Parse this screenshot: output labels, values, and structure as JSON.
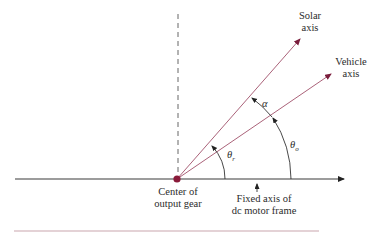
{
  "diagram": {
    "labels": {
      "solar_axis": [
        "Solar",
        "axis"
      ],
      "vehicle_axis": [
        "Vehicle",
        "axis"
      ],
      "center": [
        "Center of",
        "output gear"
      ],
      "fixed_axis": [
        "Fixed axis of",
        "dc motor frame"
      ],
      "alpha": "α",
      "theta_r_base": "θ",
      "theta_r_sub": "r",
      "theta_o_base": "θ",
      "theta_o_sub": "o"
    },
    "colors": {
      "axis_line": "#3a3a3a",
      "ray": "#a0506a",
      "arrowhead": "#7a1d3c",
      "center_dot": "#8a1a3a",
      "bottom_rule": "#c9a6ae",
      "dashed": "#555555"
    },
    "geometry": {
      "center": [
        177,
        179
      ],
      "solar_tip": [
        302,
        37
      ],
      "vehicle_tip": [
        333,
        73
      ],
      "fixed_axis_start": [
        15,
        179
      ],
      "fixed_axis_end": [
        347,
        179
      ]
    }
  }
}
